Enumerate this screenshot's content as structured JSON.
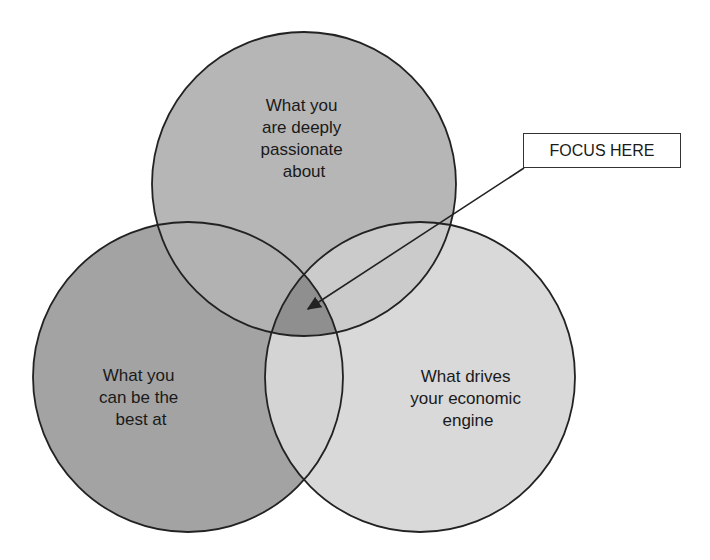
{
  "diagram": {
    "type": "venn-3",
    "circles": [
      {
        "id": "passion",
        "label_lines": [
          "What you",
          "are deeply",
          "passionate",
          "about"
        ],
        "fill": "#b6b6b6"
      },
      {
        "id": "best",
        "label_lines": [
          "What you",
          "can be the",
          "best at"
        ],
        "fill": "#a3a3a3"
      },
      {
        "id": "economic",
        "label_lines": [
          "What drives",
          "your economic",
          "engine"
        ],
        "fill": "#d9d9d9"
      }
    ],
    "overlaps": {
      "passion_best_fill": "#b2b2b2",
      "best_economic_fill": "#d4d4d4",
      "passion_economic_fill": "#cbcbcb",
      "center_fill": "#8f8f8f"
    },
    "stroke_color": "#222222",
    "callout": {
      "label": "FOCUS HERE",
      "points_to": "center"
    }
  }
}
